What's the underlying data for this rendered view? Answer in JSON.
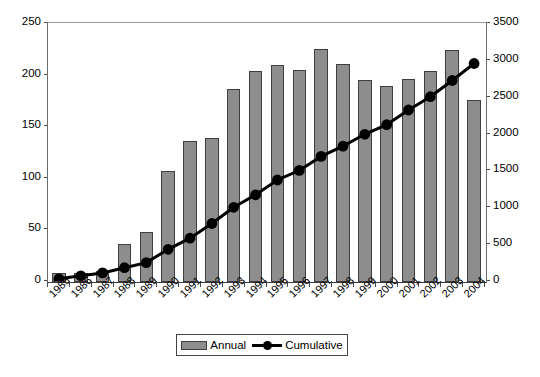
{
  "chart_data": {
    "type": "bar",
    "title": "",
    "subtitle": "",
    "xlabel": "",
    "ylabel": "",
    "y2label": "",
    "grid": false,
    "legend_position": "bottom-center",
    "categories": [
      "1985",
      "1986",
      "1987",
      "1988",
      "1989",
      "1990",
      "1991",
      "1992",
      "1993",
      "1994",
      "1995",
      "1996",
      "1997",
      "1998",
      "1999",
      "2000",
      "2001",
      "2002",
      "2003",
      "2004"
    ],
    "left_axis": {
      "ticks": [
        0,
        50,
        100,
        150,
        200,
        250
      ],
      "ylim": [
        0,
        250
      ]
    },
    "right_axis": {
      "ticks": [
        0,
        500,
        1000,
        1500,
        2000,
        2500,
        3000,
        3500
      ],
      "ylim": [
        0,
        3500
      ]
    },
    "series": [
      {
        "name": "Annual",
        "type": "bar",
        "axis": "left",
        "color": "#8d8d8d",
        "border_color": "#3f3f3f",
        "values": [
          9,
          9,
          11,
          37,
          48,
          108,
          137,
          140,
          187,
          204,
          210,
          205,
          226,
          211,
          196,
          190,
          197,
          204,
          225,
          176
        ]
      },
      {
        "name": "Cumulative",
        "type": "line",
        "axis": "right",
        "color": "#000000",
        "marker": "circle",
        "values": [
          30,
          70,
          110,
          180,
          250,
          430,
          580,
          780,
          1000,
          1170,
          1370,
          1500,
          1690,
          1830,
          1990,
          2120,
          2320,
          2500,
          2720,
          2950
        ]
      }
    ]
  },
  "legend": {
    "entries": [
      {
        "label": "Annual",
        "marker": "bar-swatch"
      },
      {
        "label": "Cumulative",
        "marker": "line-dot-swatch"
      }
    ]
  }
}
